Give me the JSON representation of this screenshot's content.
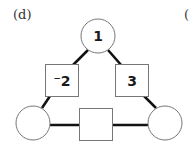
{
  "panel_label": "(d)",
  "next_panel_label_partial": "(",
  "diagram": {
    "type": "arithmagon-triangle",
    "nodes": {
      "top": {
        "value": "1"
      },
      "bottom_left": {
        "value": ""
      },
      "bottom_right": {
        "value": ""
      }
    },
    "edges": {
      "left": {
        "value": "⁻2"
      },
      "right": {
        "value": "3"
      },
      "bottom": {
        "value": ""
      }
    }
  },
  "colors": {
    "line": "#111111",
    "shape_stroke": "#777777",
    "fill": "#ffffff"
  }
}
